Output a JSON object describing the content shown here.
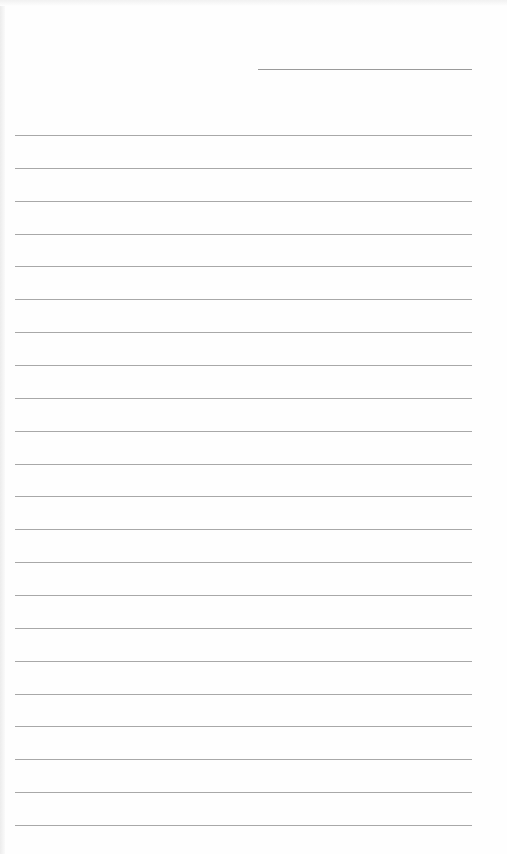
{
  "page": {
    "type": "lined-paper",
    "background": "#fefefe",
    "line_color": "#a8a8a8",
    "header_line": {
      "top": 69,
      "left": 258,
      "width": 214
    },
    "ruled_lines": {
      "count": 22,
      "first_top": 135,
      "spacing": 32.86,
      "left": 15,
      "width": 457
    }
  }
}
